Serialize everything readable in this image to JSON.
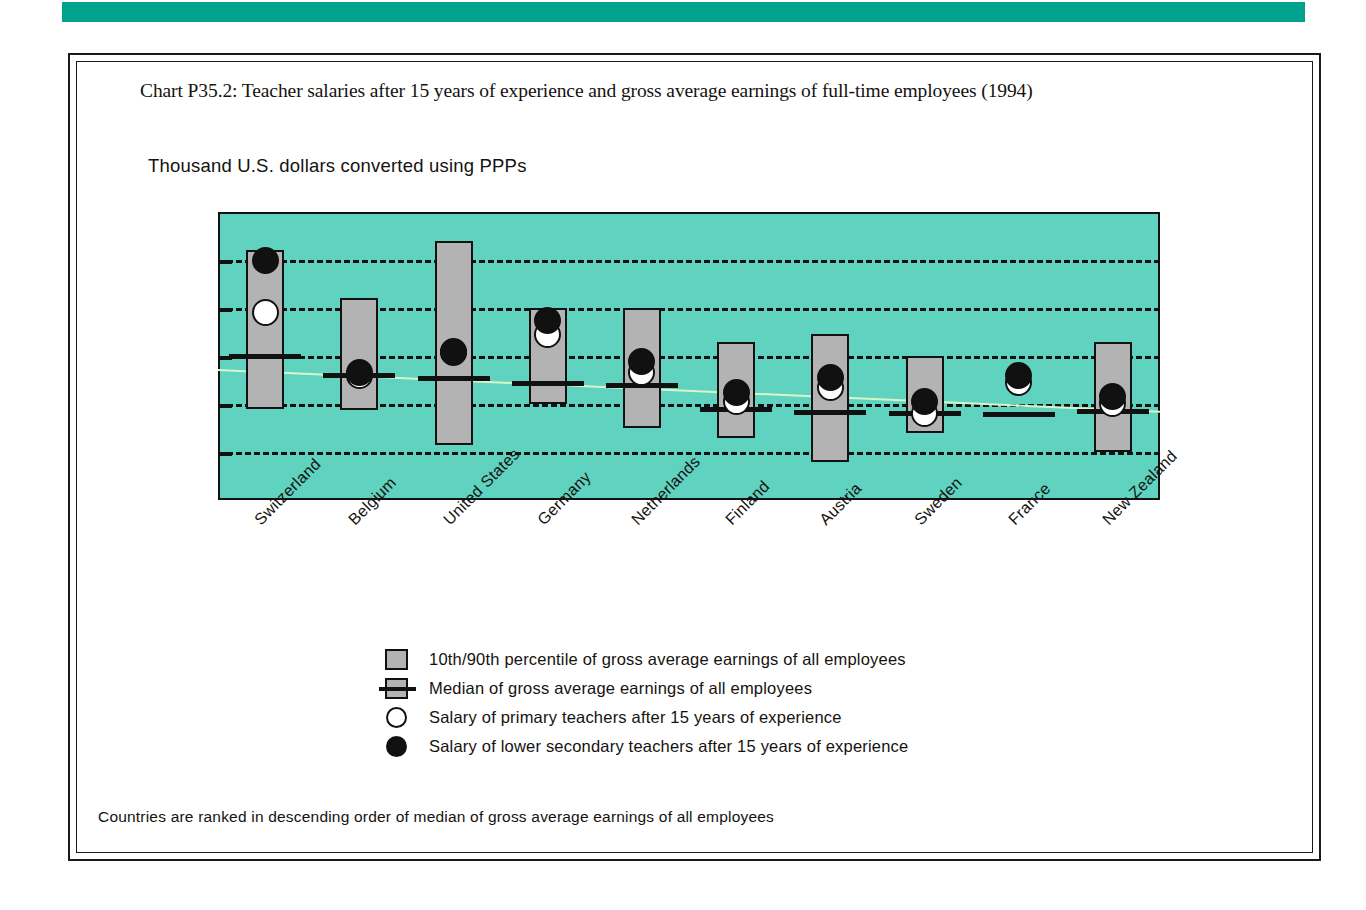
{
  "banner": {
    "color": "#00a38e"
  },
  "title": "Chart P35.2: Teacher salaries after 15 years of experience and gross average earnings of full-time employees (1994)",
  "subtitle": "Thousand U.S. dollars converted using PPPs",
  "footnote": "Countries are ranked in descending order of median of gross average earnings of all employees",
  "legend": {
    "items": [
      {
        "marker": "gray-box",
        "label": "10th/90th percentile of gross average earnings of all employees"
      },
      {
        "marker": "median-line",
        "label": "Median of gross average earnings of all employees"
      },
      {
        "marker": "open-circle",
        "label": "Salary of primary teachers after 15 years of experience"
      },
      {
        "marker": "filled-circle",
        "label": "Salary of lower secondary teachers after 15 years of experience"
      }
    ]
  },
  "chart_data": {
    "type": "bar",
    "title": "Chart P35.2: Teacher salaries after 15 years of experience and gross average earnings of full-time employees (1994)",
    "subtitle": "Thousand U.S. dollars converted using PPPs",
    "xlabel": "",
    "ylabel": "Thousand U.S. dollars converted using PPPs",
    "ylim": [
      0,
      60000
    ],
    "yticks": [
      0,
      10000,
      20000,
      30000,
      40000,
      50000,
      60000
    ],
    "ytick_labels": [
      "0",
      "10 000",
      "20 000",
      "30 000",
      "40 000",
      "50 000",
      "60 000"
    ],
    "grid": true,
    "grid_style": "dashed-horizontal",
    "legend_position": "below-plot",
    "plot_background": "#5fd3c0",
    "bar_fill": "#b3b3b3",
    "categories": [
      "Switzerland",
      "Belgium",
      "United States",
      "Germany",
      "Netherlands",
      "Finland",
      "Austria",
      "Sweden",
      "France",
      "New Zealand"
    ],
    "series": [
      {
        "name": "10th percentile of gross average earnings of all employees",
        "values": [
          19000,
          18700,
          11500,
          20000,
          15000,
          13000,
          8000,
          14000,
          null,
          10000
        ]
      },
      {
        "name": "90th percentile of gross average earnings of all employees",
        "values": [
          52000,
          42000,
          54000,
          40000,
          40000,
          33000,
          34500,
          30000,
          null,
          33000
        ]
      },
      {
        "name": "Median of gross average earnings of all employees",
        "values": [
          30500,
          26500,
          25800,
          24700,
          24300,
          19300,
          18700,
          18500,
          18400,
          19000
        ]
      },
      {
        "name": "Salary of primary teachers after 15 years of experience",
        "values": [
          39000,
          26000,
          31000,
          34500,
          26500,
          20500,
          23500,
          18000,
          24500,
          20200
        ]
      },
      {
        "name": "Salary of lower secondary teachers after 15 years of experience",
        "values": [
          50000,
          26500,
          30800,
          37500,
          28800,
          22500,
          25500,
          20500,
          26000,
          21500
        ]
      }
    ]
  }
}
